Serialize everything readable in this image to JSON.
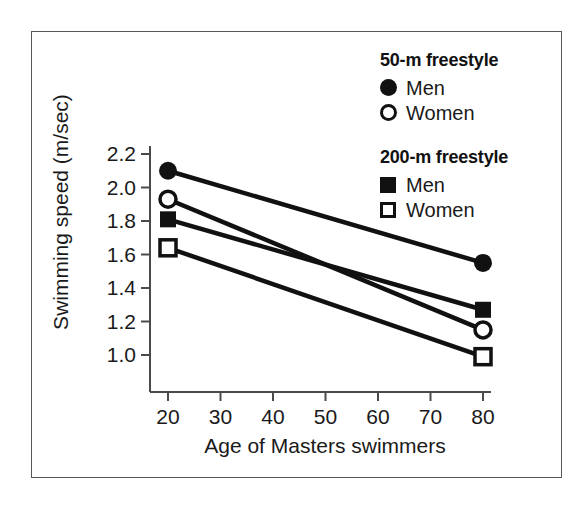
{
  "figure": {
    "background": "#ffffff",
    "frame_color": "#585858",
    "ink_color": "#111111"
  },
  "chart_data": {
    "type": "line",
    "title": "",
    "xlabel": "Age of Masters swimmers",
    "ylabel": "Swimming speed (m/sec)",
    "x": [
      20,
      80
    ],
    "xlim": [
      20,
      80
    ],
    "ylim": [
      0.9,
      2.3
    ],
    "xticks": [
      20,
      30,
      40,
      50,
      60,
      70,
      80
    ],
    "xtick_labels": [
      "20",
      "30",
      "40",
      "50",
      "60",
      "70",
      "80"
    ],
    "yticks": [
      1.0,
      1.2,
      1.4,
      1.6,
      1.8,
      2.0,
      2.2
    ],
    "ytick_labels": [
      "1.0",
      "1.2",
      "1.4",
      "1.6",
      "1.8",
      "2.0",
      "2.2"
    ],
    "grid": false,
    "legend_position": "upper right",
    "series": [
      {
        "name": "50-m freestyle Men",
        "event": "50-m freestyle",
        "sex": "Men",
        "marker": "filled-circle",
        "values": [
          2.1,
          1.55
        ]
      },
      {
        "name": "50-m freestyle Women",
        "event": "50-m freestyle",
        "sex": "Women",
        "marker": "open-circle",
        "values": [
          1.93,
          1.15
        ]
      },
      {
        "name": "200-m freestyle Men",
        "event": "200-m freestyle",
        "sex": "Men",
        "marker": "filled-square",
        "values": [
          1.81,
          1.27
        ]
      },
      {
        "name": "200-m freestyle Women",
        "event": "200-m freestyle",
        "sex": "Women",
        "marker": "open-square",
        "values": [
          1.64,
          0.99
        ]
      }
    ]
  },
  "legend": {
    "groups": [
      {
        "title": "50-m freestyle",
        "entries": [
          {
            "label": "Men",
            "marker": "filled-circle"
          },
          {
            "label": "Women",
            "marker": "open-circle"
          }
        ]
      },
      {
        "title": "200-m freestyle",
        "entries": [
          {
            "label": "Men",
            "marker": "filled-square"
          },
          {
            "label": "Women",
            "marker": "open-square"
          }
        ]
      }
    ]
  }
}
